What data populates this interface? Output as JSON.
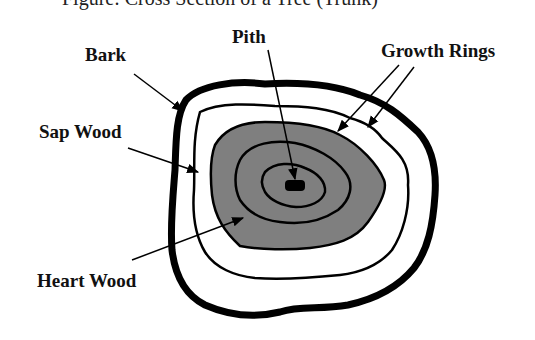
{
  "caption": "Figure: Cross Section of a Tree (Trunk)",
  "labels": {
    "bark": "Bark",
    "pith": "Pith",
    "growth_rings": "Growth Rings",
    "sap_wood": "Sap Wood",
    "heart_wood": "Heart Wood"
  },
  "colors": {
    "heartwood_fill": "#7f7f7f",
    "outline": "#000000",
    "background": "#ffffff"
  }
}
